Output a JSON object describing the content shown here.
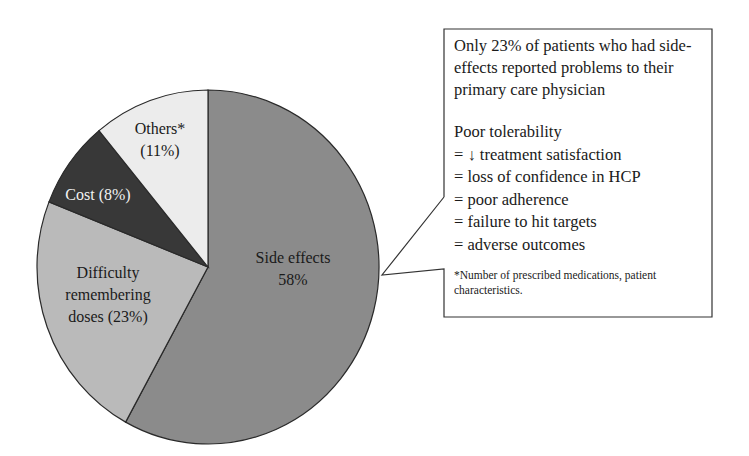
{
  "chart_data": {
    "type": "pie",
    "title": "",
    "categories": [
      "Side effects",
      "Difficulty remembering doses",
      "Cost",
      "Others*"
    ],
    "values": [
      58,
      23,
      8,
      11
    ],
    "unit": "%",
    "start_angle_deg": 0,
    "direction": "clockwise",
    "colors": [
      "#8b8b8b",
      "#bababa",
      "#383838",
      "#ececec"
    ],
    "slice_labels": [
      {
        "lines": [
          "Side effects",
          "58%"
        ],
        "text_color": "#1a1a1a"
      },
      {
        "lines": [
          "Difficulty",
          "remembering",
          "doses (23%)"
        ],
        "text_color": "#1a1a1a"
      },
      {
        "lines": [
          "Cost (8%)"
        ],
        "text_color": "#f2f2f2"
      },
      {
        "lines": [
          "Others*",
          "(11%)"
        ],
        "text_color": "#1a1a1a"
      }
    ],
    "legend": "none",
    "annotation_callout_target": "Side effects"
  },
  "callout": {
    "main_text": "Only 23% of patients who had side-effects reported problems to their primary care physician",
    "consequences_heading": "Poor tolerability",
    "consequences": [
      "= ↓ treatment satisfaction",
      "= loss of confidence in HCP",
      "= poor adherence",
      "= failure to hit targets",
      "= adverse outcomes"
    ],
    "footnote": "*Number of prescribed medications, patient characteristics."
  }
}
